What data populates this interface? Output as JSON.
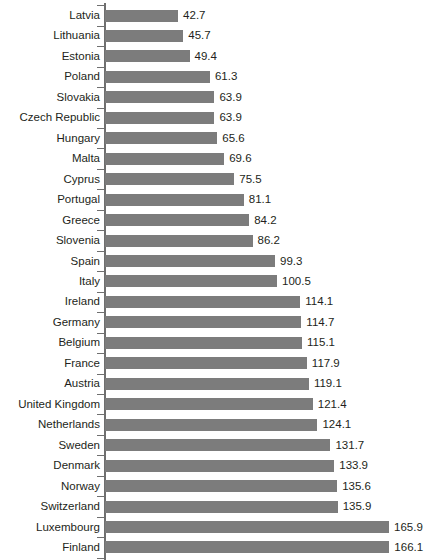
{
  "chart_data": {
    "type": "bar",
    "orientation": "horizontal",
    "title": "",
    "subtitle": "",
    "xlabel": "",
    "ylabel": "",
    "grid": false,
    "legend": false,
    "legend_position": "none",
    "xlim": [
      0,
      166.1
    ],
    "sort_order": "ascending",
    "bar_color": "#7c7c7c",
    "axis_color": "#6f6f6f",
    "background_color": "#ffffff",
    "value_labels_shown": true,
    "categories": [
      "Latvia",
      "Lithuania",
      "Estonia",
      "Poland",
      "Slovakia",
      "Czech Republic",
      "Hungary",
      "Malta",
      "Cyprus",
      "Portugal",
      "Greece",
      "Slovenia",
      "Spain",
      "Italy",
      "Ireland",
      "Germany",
      "Belgium",
      "France",
      "Austria",
      "United Kingdom",
      "Netherlands",
      "Sweden",
      "Denmark",
      "Norway",
      "Switzerland",
      "Luxembourg",
      "Finland"
    ],
    "values": [
      42.7,
      45.7,
      49.4,
      61.3,
      63.9,
      63.9,
      65.6,
      69.6,
      75.5,
      81.1,
      84.2,
      86.2,
      99.3,
      100.5,
      114.1,
      114.7,
      115.1,
      117.9,
      119.1,
      121.4,
      124.1,
      131.7,
      133.9,
      135.6,
      135.9,
      165.9,
      166.1
    ],
    "value_labels": [
      "42.7",
      "45.7",
      "49.4",
      "61.3",
      "63.9",
      "63.9",
      "65.6",
      "69.6",
      "75.5",
      "81.1",
      "84.2",
      "86.2",
      "99.3",
      "100.5",
      "114.1",
      "114.7",
      "115.1",
      "117.9",
      "119.1",
      "121.4",
      "124.1",
      "131.7",
      "133.9",
      "135.6",
      "135.9",
      "165.9",
      "166.1"
    ]
  }
}
